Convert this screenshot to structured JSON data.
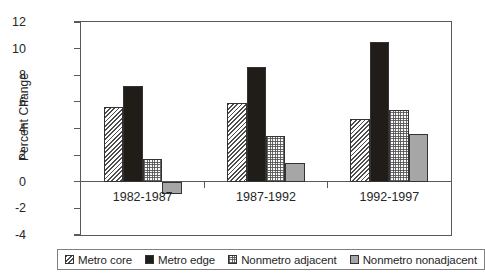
{
  "chart_data": {
    "type": "bar",
    "title": "",
    "xlabel": "",
    "ylabel": "Percent Change",
    "categories": [
      "1982-1987",
      "1987-1992",
      "1992-1997"
    ],
    "series": [
      {
        "name": "Metro core",
        "values": [
          5.6,
          5.9,
          4.7
        ],
        "fill": "diagonal-hatch",
        "color": "#4d4d4d"
      },
      {
        "name": "Metro edge",
        "values": [
          7.2,
          8.6,
          10.5
        ],
        "fill": "solid",
        "color": "#201c18"
      },
      {
        "name": "Nonmetro adjacent",
        "values": [
          1.7,
          3.4,
          5.4
        ],
        "fill": "stipple",
        "color": "#fafafa"
      },
      {
        "name": "Nonmetro nonadjacent",
        "values": [
          -0.9,
          1.4,
          3.6
        ],
        "fill": "solid-gray",
        "color": "#a6a6a6"
      }
    ],
    "ylim": [
      -4,
      12
    ],
    "ytick_labels": [
      "12",
      "10",
      "8",
      "6",
      "4",
      "2",
      "0",
      "-2",
      "-4"
    ],
    "ytick_values": [
      12,
      10,
      8,
      6,
      4,
      2,
      0,
      -2,
      -4
    ],
    "grid": false,
    "legend_position": "bottom"
  },
  "legend": {
    "entries": [
      {
        "label": "Metro core"
      },
      {
        "label": "Metro edge"
      },
      {
        "label": "Nonmetro adjacent"
      },
      {
        "label": "Nonmetro nonadjacent"
      }
    ]
  }
}
